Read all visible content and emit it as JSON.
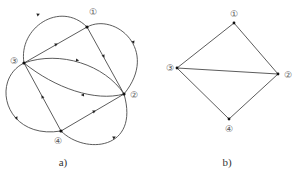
{
  "figures": [
    {
      "id": "a",
      "caption": "a)",
      "type": "directed-multigraph",
      "nodes": [
        {
          "id": "1",
          "label": "①"
        },
        {
          "id": "2",
          "label": "②"
        },
        {
          "id": "3",
          "label": "③"
        },
        {
          "id": "4",
          "label": "④"
        }
      ],
      "edges": [
        {
          "from": "3",
          "to": "1",
          "kind": "arc"
        },
        {
          "from": "3",
          "to": "1",
          "kind": "straight"
        },
        {
          "from": "1",
          "to": "2",
          "kind": "arc"
        },
        {
          "from": "1",
          "to": "2",
          "kind": "straight"
        },
        {
          "from": "3",
          "to": "2",
          "kind": "arc"
        },
        {
          "from": "2",
          "to": "3",
          "kind": "arc"
        },
        {
          "from": "3",
          "to": "4",
          "kind": "arc"
        },
        {
          "from": "4",
          "to": "3",
          "kind": "straight"
        },
        {
          "from": "4",
          "to": "2",
          "kind": "straight"
        },
        {
          "from": "4",
          "to": "2",
          "kind": "arc"
        }
      ]
    },
    {
      "id": "b",
      "caption": "b)",
      "type": "undirected-graph",
      "nodes": [
        {
          "id": "1",
          "label": "①"
        },
        {
          "id": "2",
          "label": "②"
        },
        {
          "id": "3",
          "label": "③"
        },
        {
          "id": "4",
          "label": "④"
        }
      ],
      "edges": [
        {
          "from": "3",
          "to": "1"
        },
        {
          "from": "1",
          "to": "2"
        },
        {
          "from": "3",
          "to": "2"
        },
        {
          "from": "3",
          "to": "4"
        },
        {
          "from": "4",
          "to": "2"
        }
      ]
    }
  ]
}
